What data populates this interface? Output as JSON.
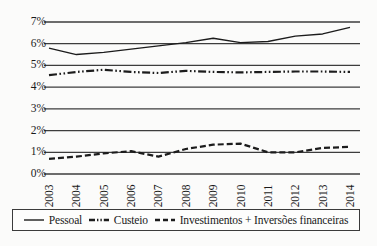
{
  "chart_data": {
    "type": "line",
    "title": "",
    "subtitle": "",
    "xlabel": "",
    "ylabel": "",
    "categories": [
      "2003",
      "2004",
      "2005",
      "2006",
      "2007",
      "2008",
      "2009",
      "2010",
      "2011",
      "2012",
      "2013",
      "2014"
    ],
    "ylim": [
      0,
      7
    ],
    "ytick_labels": [
      "0%",
      "1%",
      "2%",
      "3%",
      "4%",
      "5%",
      "6%",
      "7%"
    ],
    "ytick_values": [
      0,
      1,
      2,
      3,
      4,
      5,
      6,
      7
    ],
    "grid": "horizontal",
    "legend_position": "bottom",
    "series": [
      {
        "name": "Pessoal",
        "style": "solid",
        "color": "#1c1c1c",
        "values": [
          5.8,
          5.5,
          5.6,
          5.75,
          5.9,
          6.05,
          6.25,
          6.05,
          6.1,
          6.35,
          6.45,
          6.75
        ]
      },
      {
        "name": "Custeio",
        "style": "dash-dot-dot",
        "color": "#1c1c1c",
        "values": [
          4.55,
          4.7,
          4.8,
          4.7,
          4.65,
          4.75,
          4.7,
          4.68,
          4.7,
          4.72,
          4.72,
          4.7
        ]
      },
      {
        "name": "Investimentos + Inversões financeiras",
        "style": "dashed",
        "color": "#1c1c1c",
        "values": [
          0.7,
          0.8,
          0.95,
          1.05,
          0.8,
          1.15,
          1.35,
          1.4,
          1.0,
          1.0,
          1.2,
          1.25
        ]
      }
    ]
  },
  "legend": {
    "items": [
      {
        "label": "Pessoal",
        "style": "solid"
      },
      {
        "label": "Custeio",
        "style": "dash-dot-dot"
      },
      {
        "label": "Investimentos + Inversões financeiras",
        "style": "dashed"
      }
    ]
  },
  "axis": {
    "y_labels": [
      "7%",
      "6%",
      "5%",
      "4%",
      "3%",
      "2%",
      "1%",
      "0%"
    ],
    "x_labels": [
      "2003",
      "2004",
      "2005",
      "2006",
      "2007",
      "2008",
      "2009",
      "2010",
      "2011",
      "2012",
      "2013",
      "2014"
    ]
  },
  "colors": {
    "line": "#1c1c1c",
    "grid": "#3d3d3d",
    "background": "#fbfbfa",
    "legend_border": "#3b3b3b"
  }
}
